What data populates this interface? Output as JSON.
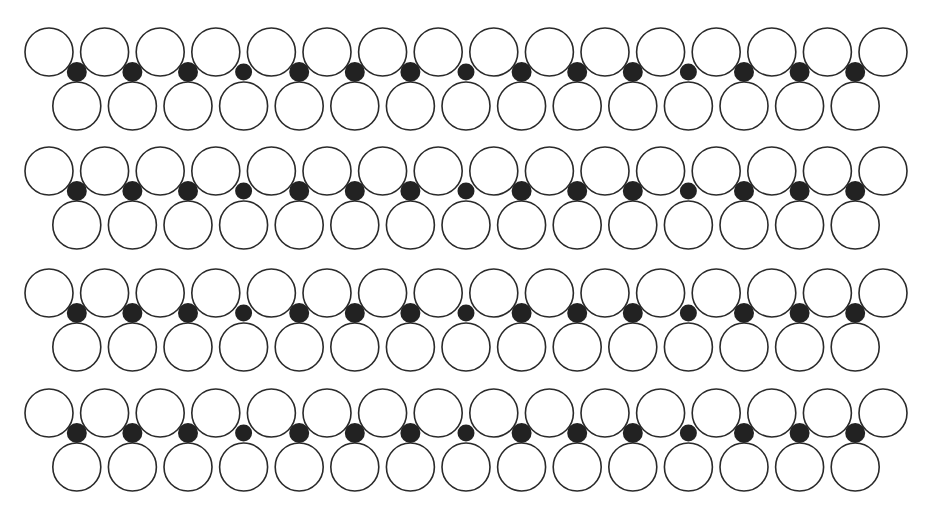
{
  "diagram": {
    "type": "chain-structure",
    "colors": {
      "background": "#ffffff",
      "circle_stroke": "#2a2a2a",
      "circle_fill": "#ffffff",
      "dot_fill": "#222222"
    },
    "geometry": {
      "circle_radius": 24,
      "dot_radius": 10,
      "pitch": 55.6,
      "first_x": 49,
      "top_circles_per_row": 16,
      "bottom_circles_per_row": 15,
      "dots_per_row": 15
    },
    "rows": [
      {
        "id": "row-1",
        "top_y": 52,
        "dot_y": 72,
        "bottom_y": 106
      },
      {
        "id": "row-2",
        "top_y": 171,
        "dot_y": 191,
        "bottom_y": 225
      },
      {
        "id": "row-3",
        "top_y": 293,
        "dot_y": 313,
        "bottom_y": 347
      },
      {
        "id": "row-4",
        "top_y": 413,
        "dot_y": 433,
        "bottom_y": 467
      }
    ]
  }
}
